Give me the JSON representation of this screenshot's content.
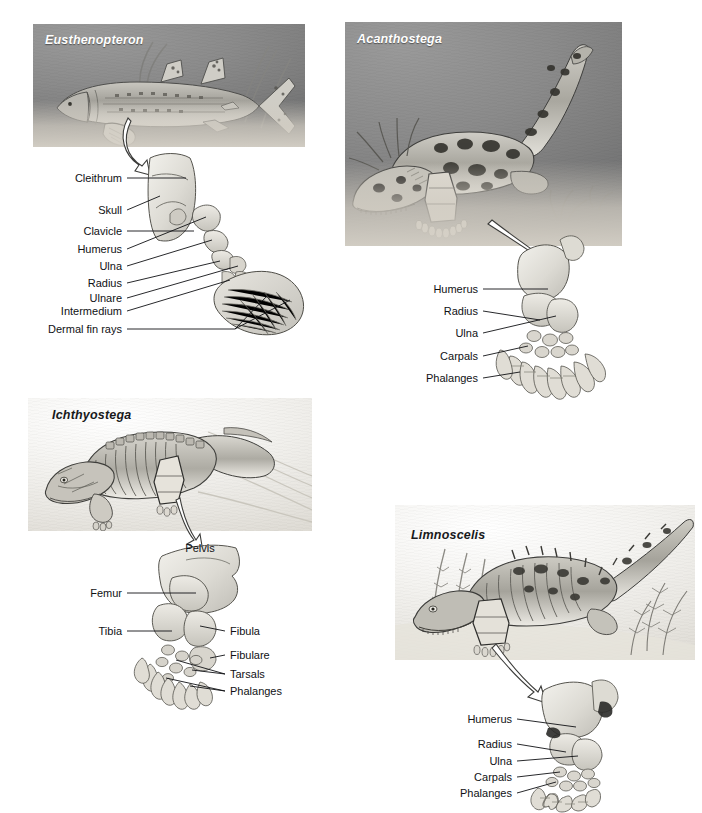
{
  "figure": {
    "background_color": "#ffffff",
    "label_color": "#101114",
    "panel_dark_color": "#8b8b8b",
    "panel_light_color": "#f1efeb"
  },
  "panels": [
    {
      "id": "eusthenopteron",
      "genus": "Eusthenopteron",
      "genus_color": "#ffffff",
      "scene_style": "dark",
      "scene": {
        "x": 33,
        "y": 24,
        "w": 272,
        "h": 123
      },
      "limb_caption": "pectoral fin skeleton",
      "labels": [
        {
          "text": "Cleithrum",
          "side": "right",
          "x": 122,
          "y": 178
        },
        {
          "text": "Skull",
          "side": "right",
          "x": 122,
          "y": 210
        },
        {
          "text": "Clavicle",
          "side": "right",
          "x": 122,
          "y": 231
        },
        {
          "text": "Humerus",
          "side": "right",
          "x": 122,
          "y": 249
        },
        {
          "text": "Ulna",
          "side": "right",
          "x": 122,
          "y": 266
        },
        {
          "text": "Radius",
          "side": "right",
          "x": 122,
          "y": 283
        },
        {
          "text": "Ulnare",
          "side": "right",
          "x": 122,
          "y": 298
        },
        {
          "text": "Intermedium",
          "side": "right",
          "x": 122,
          "y": 311
        },
        {
          "text": "Dermal fin rays",
          "side": "right",
          "x": 122,
          "y": 329
        }
      ]
    },
    {
      "id": "acanthostega",
      "genus": "Acanthostega",
      "genus_color": "#ffffff",
      "scene_style": "dark",
      "scene": {
        "x": 345,
        "y": 22,
        "w": 277,
        "h": 224
      },
      "limb_caption": "forelimb with eight digits",
      "labels": [
        {
          "text": "Humerus",
          "side": "right",
          "x": 478,
          "y": 289
        },
        {
          "text": "Radius",
          "side": "right",
          "x": 478,
          "y": 311
        },
        {
          "text": "Ulna",
          "side": "right",
          "x": 478,
          "y": 333
        },
        {
          "text": "Carpals",
          "side": "right",
          "x": 478,
          "y": 356
        },
        {
          "text": "Phalanges",
          "side": "right",
          "x": 478,
          "y": 378
        }
      ]
    },
    {
      "id": "ichthyostega",
      "genus": "Ichthyostega",
      "genus_color": "#18191b",
      "scene_style": "light",
      "scene": {
        "x": 28,
        "y": 398,
        "w": 284,
        "h": 133
      },
      "limb_caption": "hindlimb and pelvis",
      "labels": [
        {
          "text": "Pelvis",
          "side": "center",
          "x": 200,
          "y": 548
        },
        {
          "text": "Femur",
          "side": "right",
          "x": 122,
          "y": 593
        },
        {
          "text": "Tibia",
          "side": "right",
          "x": 122,
          "y": 631
        },
        {
          "text": "Fibula",
          "side": "left",
          "x": 230,
          "y": 631
        },
        {
          "text": "Fibulare",
          "side": "left",
          "x": 230,
          "y": 655
        },
        {
          "text": "Tarsals",
          "side": "left",
          "x": 230,
          "y": 674
        },
        {
          "text": "Phalanges",
          "side": "left",
          "x": 230,
          "y": 691
        }
      ]
    },
    {
      "id": "limnoscelis",
      "genus": "Limnoscelis",
      "genus_color": "#18191b",
      "scene_style": "light",
      "scene": {
        "x": 395,
        "y": 505,
        "w": 300,
        "h": 155
      },
      "limb_caption": "forelimb with five digits",
      "labels": [
        {
          "text": "Humerus",
          "side": "right",
          "x": 512,
          "y": 719
        },
        {
          "text": "Radius",
          "side": "right",
          "x": 512,
          "y": 744
        },
        {
          "text": "Ulna",
          "side": "right",
          "x": 512,
          "y": 761
        },
        {
          "text": "Carpals",
          "side": "right",
          "x": 512,
          "y": 777
        },
        {
          "text": "Phalanges",
          "side": "right",
          "x": 512,
          "y": 793
        }
      ]
    }
  ]
}
